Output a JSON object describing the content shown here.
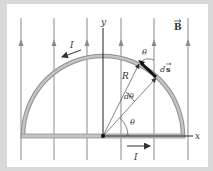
{
  "diagram": {
    "labels": {
      "field": "B",
      "y_axis": "y",
      "x_axis": "x",
      "current_top": "I",
      "current_bottom": "I",
      "radius": "R",
      "angle_element": "dθ",
      "angle_theta": "θ",
      "angle_theta_top": "θ",
      "line_element_d": "d",
      "line_element_s": "s"
    },
    "colors": {
      "frame": "#d9d9d9",
      "field_line": "#8a8a8a",
      "wire": "#b5b5b5",
      "wire_edge": "#8f8f8f",
      "axis": "#222222",
      "ds_segment": "#111111",
      "text": "#333333"
    },
    "geometry": {
      "origin": [
        103,
        136
      ],
      "radius_px": 80,
      "field_line_x": [
        21,
        54,
        87,
        121,
        154,
        188
      ]
    }
  }
}
